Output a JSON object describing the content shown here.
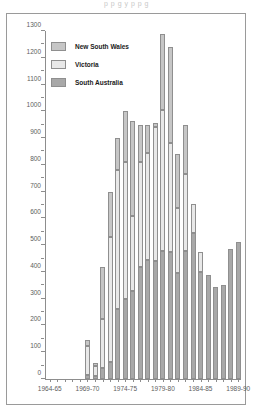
{
  "ghost_text": "p          p        g        y    p   p    g",
  "chart_data": {
    "type": "bar",
    "stacked": true,
    "title": "",
    "xlabel": "",
    "ylabel": "",
    "ylim": [
      0,
      1300
    ],
    "ytick_step": 100,
    "yticks": [
      0,
      100,
      200,
      300,
      400,
      500,
      600,
      700,
      800,
      900,
      1000,
      1100,
      1200,
      1300
    ],
    "grid": false,
    "legend_position": "top-left",
    "categories": [
      "1964-65",
      "1965-66",
      "1966-67",
      "1967-68",
      "1968-69",
      "1969-70",
      "1970-71",
      "1971-72",
      "1972-73",
      "1973-74",
      "1974-75",
      "1975-76",
      "1976-77",
      "1977-78",
      "1978-79",
      "1979-80",
      "1980-81",
      "1981-82",
      "1982-83",
      "1983-84",
      "1984-85",
      "1985-86",
      "1986-87",
      "1987-88",
      "1988-89",
      "1989-90"
    ],
    "xtick_labels": [
      "1964-65",
      "1969-70",
      "1974-75",
      "1979-80",
      "1984-85",
      "1989-90"
    ],
    "xtick_indices": [
      0,
      5,
      10,
      15,
      20,
      25
    ],
    "series": [
      {
        "name": "South Australia",
        "color": "#a8a8a8",
        "values": [
          0,
          0,
          0,
          0,
          0,
          15,
          10,
          40,
          65,
          260,
          300,
          330,
          420,
          445,
          440,
          480,
          475,
          395,
          480,
          545,
          400,
          390,
          345,
          350,
          485,
          510
        ]
      },
      {
        "name": "Victoria",
        "color": "#e8e8e8",
        "values": [
          0,
          0,
          0,
          0,
          0,
          110,
          40,
          185,
          465,
          520,
          510,
          280,
          390,
          400,
          500,
          525,
          405,
          245,
          285,
          110,
          75,
          0,
          0,
          0,
          0,
          0
        ]
      },
      {
        "name": "New South Wales",
        "color": "#c6c6c6",
        "values": [
          0,
          0,
          0,
          0,
          0,
          20,
          10,
          195,
          170,
          120,
          190,
          355,
          140,
          105,
          15,
          285,
          360,
          200,
          185,
          0,
          0,
          0,
          0,
          0,
          0,
          0
        ]
      }
    ],
    "totals": [
      0,
      0,
      0,
      0,
      0,
      145,
      60,
      420,
      700,
      900,
      1000,
      965,
      950,
      950,
      955,
      1290,
      1240,
      840,
      950,
      655,
      475,
      390,
      345,
      350,
      485,
      510
    ],
    "legend": [
      {
        "label": "New South Wales",
        "color": "#c6c6c6"
      },
      {
        "label": "Victoria",
        "color": "#e8e8e8"
      },
      {
        "label": "South Australia",
        "color": "#a8a8a8"
      }
    ]
  }
}
